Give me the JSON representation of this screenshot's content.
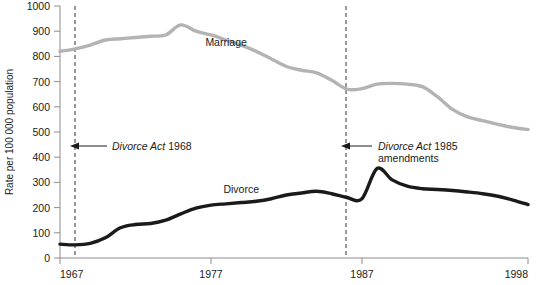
{
  "chart_data": {
    "type": "line",
    "title": "",
    "xlabel": "",
    "ylabel": "Rate per 100 000 population",
    "xlim": [
      1967,
      1998
    ],
    "ylim": [
      0,
      1000
    ],
    "grid": false,
    "legend_position": "inline-labels",
    "x_ticks": [
      "1967",
      "1977",
      "1987",
      "1998"
    ],
    "x_tick_values": [
      1967,
      1977,
      1987,
      1998
    ],
    "y_ticks": [
      "0",
      "100",
      "200",
      "300",
      "400",
      "500",
      "600",
      "700",
      "800",
      "900",
      "1000"
    ],
    "y_tick_values": [
      0,
      100,
      200,
      300,
      400,
      500,
      600,
      700,
      800,
      900,
      1000
    ],
    "series": [
      {
        "name": "Marriage",
        "color": "#b3b3b3",
        "label_x": 1978,
        "label_y": 840,
        "x": [
          1967,
          1968,
          1969,
          1970,
          1971,
          1972,
          1973,
          1974,
          1975,
          1976,
          1977,
          1978,
          1979,
          1980,
          1981,
          1982,
          1983,
          1984,
          1985,
          1986,
          1987,
          1988,
          1989,
          1990,
          1991,
          1992,
          1993,
          1994,
          1995,
          1996,
          1997,
          1998
        ],
        "values": [
          820,
          830,
          845,
          865,
          870,
          875,
          880,
          885,
          925,
          900,
          885,
          865,
          845,
          820,
          790,
          760,
          745,
          735,
          705,
          670,
          672,
          690,
          693,
          690,
          680,
          640,
          590,
          560,
          545,
          530,
          518,
          510
        ]
      },
      {
        "name": "Divorce",
        "color": "#1a1a1a",
        "label_x": 1979,
        "label_y": 260,
        "x": [
          1967,
          1968,
          1969,
          1970,
          1971,
          1972,
          1973,
          1974,
          1975,
          1976,
          1977,
          1978,
          1979,
          1980,
          1981,
          1982,
          1983,
          1984,
          1985,
          1986,
          1987,
          1988,
          1989,
          1990,
          1991,
          1992,
          1993,
          1994,
          1995,
          1996,
          1997,
          1998
        ],
        "values": [
          55,
          52,
          58,
          80,
          120,
          133,
          137,
          150,
          175,
          198,
          210,
          215,
          220,
          225,
          235,
          250,
          258,
          265,
          255,
          240,
          235,
          355,
          310,
          285,
          275,
          272,
          268,
          262,
          255,
          245,
          230,
          212
        ]
      }
    ],
    "annotations": [
      {
        "name": "divorce-act-1968",
        "line1_italic": "Divorce Act",
        "line1_plain": " 1968",
        "line2": "",
        "marker_year": 1968,
        "text_y": 440,
        "vline_year": 1968
      },
      {
        "name": "divorce-act-1985-amendments",
        "line1_italic": "Divorce Act",
        "line1_plain": " 1985",
        "line2": "amendments",
        "marker_year": 1986,
        "text_y": 440,
        "vline_year": 1986
      }
    ]
  }
}
